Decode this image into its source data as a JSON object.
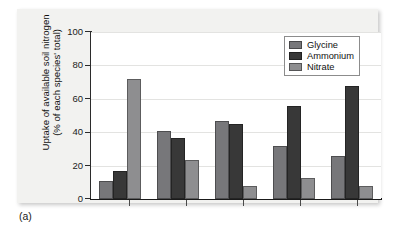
{
  "figure": {
    "caption": "(a)"
  },
  "chart_data": {
    "type": "bar",
    "title": "",
    "xlabel": "",
    "ylabel": "Uptake of available soil nitrogen (% of each species' total)",
    "ylabel_line1": "Uptake of available soil nitrogen",
    "ylabel_line2": "(% of each species' total)",
    "ylim": [
      0,
      100
    ],
    "yticks": [
      0,
      20,
      40,
      60,
      80,
      100
    ],
    "ytick_labels": [
      "0",
      "20",
      "40",
      "60",
      "80",
      "100"
    ],
    "grid": true,
    "grid_axis": "y",
    "legend_position": "top-right",
    "categories": [
      "1",
      "2",
      "3",
      "4",
      "5"
    ],
    "xtick_labels": [
      "",
      "",
      "",
      "",
      ""
    ],
    "series": [
      {
        "name": "Glycine",
        "color": "#77777a",
        "values": [
          11,
          40.5,
          47,
          32,
          26
        ]
      },
      {
        "name": "Ammonium",
        "color": "#383838",
        "values": [
          16.5,
          36.5,
          45,
          56,
          67.5
        ]
      },
      {
        "name": "Nitrate",
        "color": "#8e8e90",
        "values": [
          72,
          23.5,
          8,
          12.5,
          8
        ]
      }
    ]
  }
}
